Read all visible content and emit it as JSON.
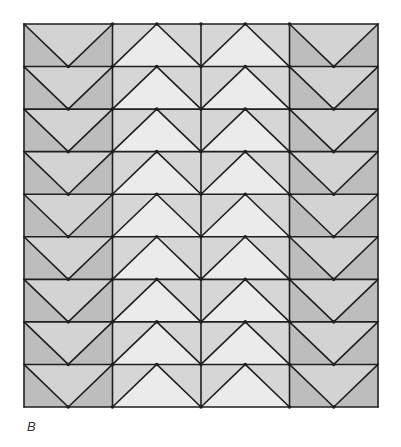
{
  "figure": {
    "label": "B",
    "grid": {
      "x0": 24,
      "y0": 24,
      "x1": 378,
      "y1": 407,
      "columns": 4,
      "rows": 9,
      "column_types": [
        "V",
        "A",
        "A",
        "V"
      ]
    },
    "colors": {
      "line": "#1f1f1f",
      "outer_center": "#d3d3d3",
      "outer_sides": "#bdbdbd",
      "inner_center": "#ebebeb",
      "inner_sides": "#d6d6d6",
      "background": "#ffffff"
    },
    "line_width": 1.6
  }
}
